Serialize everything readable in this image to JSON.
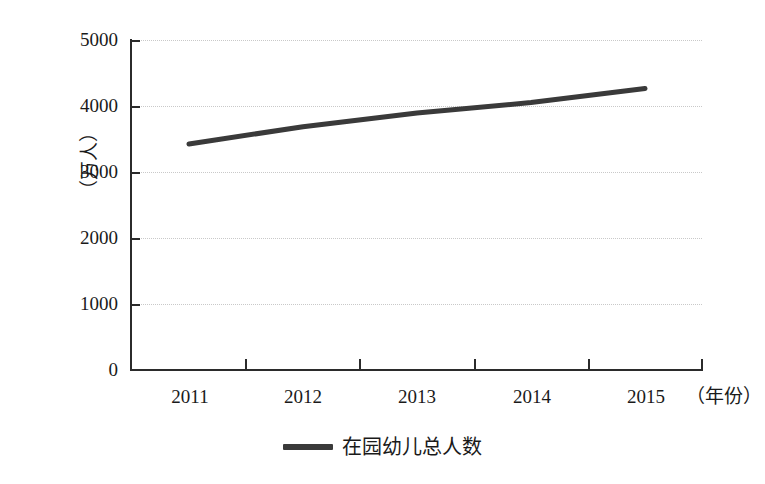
{
  "chart_data": {
    "type": "line",
    "title": "",
    "subtitle": "",
    "xlabel": "（年份）",
    "ylabel": "（万人）",
    "categories": [
      "2011",
      "2012",
      "2013",
      "2014",
      "2015"
    ],
    "series": [
      {
        "name": "在园幼儿总人数",
        "values": [
          3424,
          3686,
          3895,
          4051,
          4265
        ],
        "color": "#3a3a3a"
      }
    ],
    "ylim": [
      0,
      5000
    ],
    "ytick_values": [
      0,
      1000,
      2000,
      3000,
      4000,
      5000
    ],
    "ytick_labels": [
      "0",
      "1000",
      "2000",
      "3000",
      "4000",
      "5000"
    ],
    "grid": true,
    "grid_style": "dotted",
    "grid_color": "#c9c9c9",
    "legend_position": "bottom",
    "axis_color": "#2b2b2b",
    "background": "#ffffff"
  },
  "legend": {
    "entries": [
      {
        "label": "在园幼儿总人数"
      }
    ]
  },
  "axes": {
    "y_title": "（万人）",
    "x_unit": "（年份）"
  }
}
